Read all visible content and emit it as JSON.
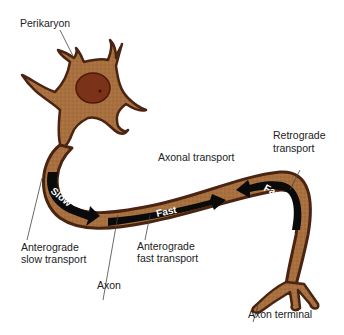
{
  "labels": {
    "perikaryon": "Perikaryon",
    "axonal_transport": "Axonal transport",
    "retrograde_line1": "Retrograde",
    "retrograde_line2": "transport",
    "antero_slow_line1": "Anterograde",
    "antero_slow_line2": "slow transport",
    "antero_fast_line1": "Anterograde",
    "antero_fast_line2": "fast transport",
    "axon": "Axon",
    "axon_terminal": "Axon terminal"
  },
  "arrows": {
    "slow": "Slow",
    "fast_antero": "Fast",
    "fast_retro": "Fast"
  },
  "colors": {
    "cytoplasm": "#a8703f",
    "outline": "#4a2412",
    "nucleus": "#7a3318",
    "arrow": "#0a0a0a"
  }
}
